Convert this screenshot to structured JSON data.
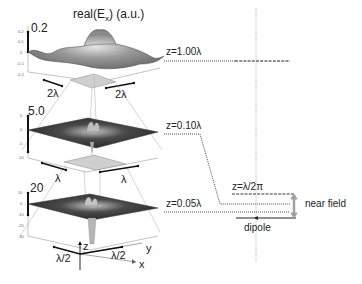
{
  "title": "real(E",
  "title_sub": "x",
  "title_suffix": ") (a.u.)",
  "panels": [
    {
      "scale_label": "0.2",
      "ticks": [
        "0.2",
        "0.1",
        "0",
        "-0.1",
        "-0.2"
      ],
      "x_span": "2λ",
      "y_span": "2λ",
      "z_label": "z=1.00λ"
    },
    {
      "scale_label": "5.0",
      "ticks": [
        "5",
        "0",
        "-5",
        "-10"
      ],
      "x_span": "λ",
      "y_span": "λ",
      "z_label": "z=0.10λ"
    },
    {
      "scale_label": "20",
      "ticks": [
        "10",
        "0",
        "-10",
        "-20",
        "-30"
      ],
      "x_span": "λ/2",
      "y_span": "λ/2",
      "z_label": "z=0.05λ"
    }
  ],
  "axes": {
    "x": "x",
    "y": "y",
    "z": "z"
  },
  "right": {
    "z_near_label": "z=λ/2π",
    "near_field_label": "near field",
    "dipole_label": "dipole"
  },
  "colors": {
    "surface_light": "#c8c8c8",
    "surface_dark": "#3a3a3a",
    "line": "#222222",
    "grey_arrow": "#a0a0a0"
  }
}
